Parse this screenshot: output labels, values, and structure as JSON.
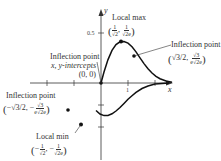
{
  "diagram": {
    "function": "y = x e^{-x^2}",
    "axes": {
      "x_label": "x",
      "y_label": "y",
      "x_ticks": [
        "-2",
        "-1",
        "1",
        "2"
      ],
      "x_tick_labels_visible": [
        "1"
      ],
      "y_tick_labels_visible": [
        "0.5"
      ]
    },
    "annotations": {
      "local_max": {
        "title": "Local max",
        "x_num": "1",
        "x_den": "√2",
        "y_num": "1",
        "y_den": "√2e"
      },
      "inflection_right": {
        "title": "Inflection point",
        "x": "√3/2",
        "y_num": "√3",
        "y_den": "e√2e"
      },
      "origin": {
        "line1": "Inflection point",
        "line2": "x, y-intercepts",
        "line3": "(0, 0)"
      },
      "inflection_left": {
        "title": "Inflection point",
        "x": "−√3/2",
        "y_num": "√3",
        "y_den": "e√2e",
        "y_sign": "−"
      },
      "local_min": {
        "title": "Local min",
        "x_num": "1",
        "x_den": "√2",
        "y_num": "1",
        "y_den": "√2e",
        "sign": "−"
      }
    },
    "colors": {
      "curve": "#111111",
      "axis": "#333333",
      "text": "#333333"
    }
  }
}
